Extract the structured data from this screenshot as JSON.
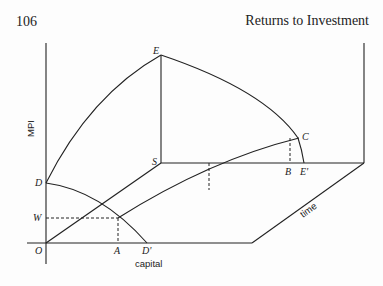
{
  "header": {
    "page_number": "106",
    "running_head": "Returns to Investment"
  },
  "figure": {
    "axis_labels": {
      "vertical": "MPI",
      "horizontal": "capital",
      "depth": "time"
    },
    "point_labels": {
      "E": "E",
      "S": "S",
      "C": "C",
      "B": "B",
      "E_prime": "E'",
      "D": "D",
      "W": "W",
      "O": "O",
      "A": "A",
      "D_prime": "D'"
    },
    "colors": {
      "ink": "#222222",
      "paper": "#fdfdfd"
    }
  }
}
